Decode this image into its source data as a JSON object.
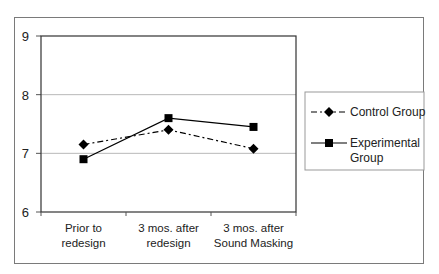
{
  "chart_data": {
    "type": "line",
    "title": "",
    "xlabel": "",
    "ylabel": "",
    "ylim": [
      6,
      9
    ],
    "yticks": [
      "6",
      "7",
      "8",
      "9"
    ],
    "grid": true,
    "legend_position": "right",
    "categories": [
      [
        "Prior to",
        "redesign"
      ],
      [
        "3 mos. after",
        "redesign"
      ],
      [
        "3 mos. after",
        "Sound Masking"
      ]
    ],
    "series": [
      {
        "name": "Control Group",
        "legend_lines": [
          "Control Group"
        ],
        "marker": "diamond",
        "line_style": "dash-dot",
        "color": "#000000",
        "values": [
          7.15,
          7.4,
          7.08
        ]
      },
      {
        "name": "Experimental Group",
        "legend_lines": [
          "Experimental",
          "Group"
        ],
        "marker": "square",
        "line_style": "solid",
        "color": "#000000",
        "values": [
          6.9,
          7.6,
          7.45
        ]
      }
    ]
  }
}
